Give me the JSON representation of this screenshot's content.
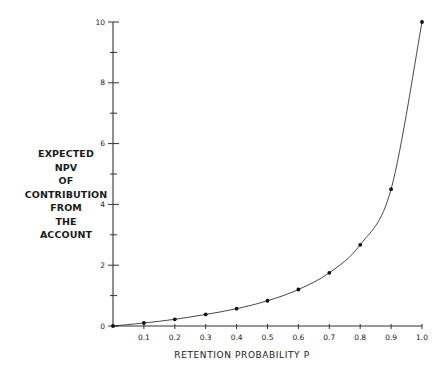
{
  "chart_data": {
    "type": "line",
    "title": "",
    "xlabel": "RETENTION PROBABILITY P",
    "ylabel_lines": [
      "EXPECTED",
      "NPV",
      "OF",
      "CONTRIBUTION",
      "FROM",
      "THE",
      "ACCOUNT"
    ],
    "x": [
      0,
      0.1,
      0.2,
      0.3,
      0.4,
      0.5,
      0.6,
      0.7,
      0.8,
      0.9,
      1.0
    ],
    "series": [
      {
        "name": "Expected NPV",
        "values": [
          0,
          0.1,
          0.22,
          0.38,
          0.57,
          0.83,
          1.2,
          1.75,
          2.67,
          4.5,
          10
        ],
        "markers": true,
        "smooth": true
      }
    ],
    "xticks": [
      "0.1",
      "0.2",
      "0.3",
      "0.4",
      "0.5",
      "0.6",
      "0.7",
      "0.8",
      "0.9",
      "1.0"
    ],
    "yticks_labeled": [
      "0",
      "2",
      "4",
      "6",
      "8",
      "10"
    ],
    "yticks_minor": [
      1,
      3,
      5,
      7,
      9
    ],
    "xlim": [
      0,
      1.0
    ],
    "ylim": [
      0,
      10
    ],
    "grid": false,
    "legend": "none"
  }
}
